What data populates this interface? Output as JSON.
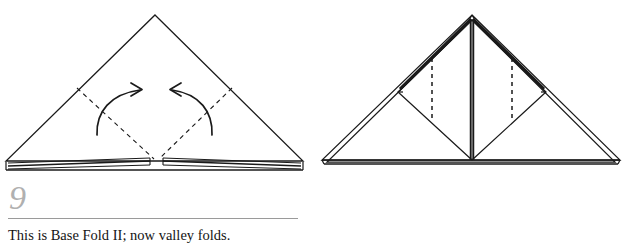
{
  "document": {
    "type": "origami-instruction-steps",
    "background_color": "#ffffff",
    "ink_color": "#1a1a1a",
    "step_number_color": "#b0b0b0",
    "rule_color": "#9a9a9a"
  },
  "steps": [
    {
      "number": "9",
      "caption": "This is Base Fold II; now valley folds.",
      "diagram": {
        "name": "base-fold-two-with-valley-fold-marks",
        "shape": "wide-triangle",
        "apex": [
          155,
          15
        ],
        "left_vertex": [
          6,
          162
        ],
        "right_vertex": [
          303,
          162
        ],
        "dashed_folds": [
          {
            "name": "left-valley-crease",
            "from": [
              77,
              88
            ],
            "to": [
              155,
              160
            ]
          },
          {
            "name": "right-valley-crease",
            "from": [
              232,
              88
            ],
            "to": [
              158,
              160
            ]
          }
        ],
        "arrows": [
          {
            "name": "left-fold-arrow",
            "direction": "up-right",
            "tip": [
              142,
              89
            ]
          },
          {
            "name": "right-fold-arrow",
            "direction": "up-left",
            "tip": [
              170,
              89
            ]
          }
        ],
        "layered_bottom_edge": true,
        "center_gap": true
      }
    },
    {
      "number": "10",
      "caption": "Valley folds.",
      "diagram": {
        "name": "folded-result-with-vertical-valley-marks",
        "shape": "wide-triangle-with-inner-diamonds",
        "apex": [
          472,
          15
        ],
        "left_vertex": [
          322,
          162
        ],
        "right_vertex": [
          620,
          162
        ],
        "center_spine": {
          "from": [
            472,
            18
          ],
          "to": [
            472,
            162
          ]
        },
        "inner_flaps": [
          {
            "name": "left-flap",
            "top": [
              472,
              20
            ],
            "outer": [
              398,
              92
            ],
            "bottom": [
              472,
              162
            ]
          },
          {
            "name": "right-flap",
            "top": [
              472,
              20
            ],
            "outer": [
              546,
              92
            ],
            "bottom": [
              472,
              162
            ]
          }
        ],
        "dashed_folds": [
          {
            "name": "left-vertical-crease",
            "x": 432,
            "from_y": 58,
            "to_y": 122
          },
          {
            "name": "right-vertical-crease",
            "x": 512,
            "from_y": 58,
            "to_y": 122
          }
        ],
        "thick_edges": [
          {
            "name": "left-upper-thick-edge",
            "from": [
              472,
              18
            ],
            "to": [
              398,
              90
            ]
          },
          {
            "name": "right-upper-thick-edge",
            "from": [
              472,
              18
            ],
            "to": [
              546,
              90
            ]
          }
        ]
      }
    }
  ]
}
